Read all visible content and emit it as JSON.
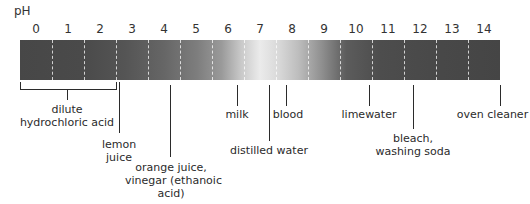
{
  "title": "pH",
  "scale": {
    "numbers": [
      "0",
      "1",
      "2",
      "3",
      "4",
      "5",
      "6",
      "7",
      "8",
      "9",
      "10",
      "11",
      "12",
      "13",
      "14"
    ],
    "colors": {
      "strong": "#474747",
      "neutral": "#ebebeb",
      "divider": "#ffffff",
      "line": "#2b2b2b"
    }
  },
  "labels": {
    "dilute_hcl": {
      "line1": "dilute",
      "line2": "hydrochloric acid",
      "ph_range": "0-2"
    },
    "lemon_juice": {
      "line1": "lemon",
      "line2": "juice",
      "ph": "2-3"
    },
    "orange_juice": {
      "line1": "orange juice,",
      "line2": "vinegar (ethanoic",
      "line3": "acid)",
      "ph": "4"
    },
    "milk": {
      "text": "milk",
      "ph": "6.5"
    },
    "distilled_water": {
      "text": "distilled water",
      "ph": "7"
    },
    "blood": {
      "text": "blood",
      "ph": "7.5"
    },
    "limewater": {
      "text": "limewater",
      "ph": "10"
    },
    "bleach": {
      "line1": "bleach,",
      "line2": "washing soda",
      "ph": "11.5"
    },
    "oven_cleaner": {
      "text": "oven cleaner",
      "ph": "14"
    }
  }
}
